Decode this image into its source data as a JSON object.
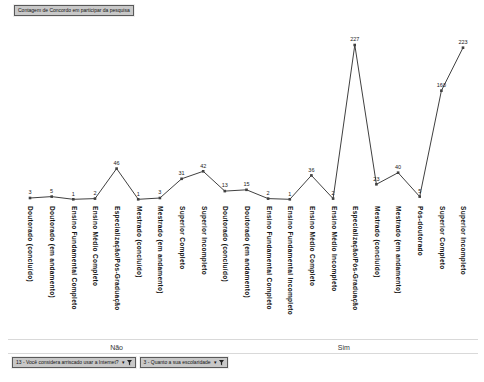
{
  "pivot": {
    "value_field_button": "Contagem de Concordo em participar da pesquisa",
    "filter_buttons": [
      {
        "label": "13 - Você considera arriscado usar a Internet?",
        "icon": "dropdown-funnel"
      },
      {
        "label": "3 - Quanto a sua escolaridade",
        "icon": "dropdown-funnel"
      }
    ]
  },
  "chart_data": {
    "type": "line",
    "title": "Contagem de Concordo em participar da pesquisa",
    "legend": "none",
    "grid": false,
    "data_labels": true,
    "ylim": [
      0,
      240
    ],
    "line_color": "#404040",
    "marker_shape": "square",
    "label_color": "#1a1a1a",
    "axis_line_color": "#c9c9c9",
    "group_axis_label_style": "rotated-90-down",
    "groups": [
      {
        "label": "Não",
        "categories": [
          "Doutorado (concluído)",
          "Doutorado (em andamento)",
          "Ensino Fundamental Completo",
          "Ensino Médio Completo",
          "Especialização/Pós-Graduação",
          "Mestrado (concluído)",
          "Mestrado (em andamento)",
          "Superior Completo",
          "Superior Incompleto"
        ],
        "values": [
          3,
          5,
          1,
          2,
          46,
          1,
          3,
          31,
          42
        ]
      },
      {
        "label": "Sim",
        "categories": [
          "Doutorado (concluído)",
          "Doutorado (em andamento)",
          "Ensino Fundamental Completo",
          "Ensino Fundamental Incompleto",
          "Ensino Médio Completo",
          "Ensino Médio Incompleto",
          "Especialização/Pós-Graduação",
          "Mestrado (concluído)",
          "Mestrado (em andamento)",
          "Pós-doutorado",
          "Superior Completo",
          "Superior Incompleto"
        ],
        "values": [
          13,
          15,
          2,
          1,
          36,
          2,
          227,
          23,
          40,
          5,
          160,
          223
        ]
      }
    ]
  }
}
